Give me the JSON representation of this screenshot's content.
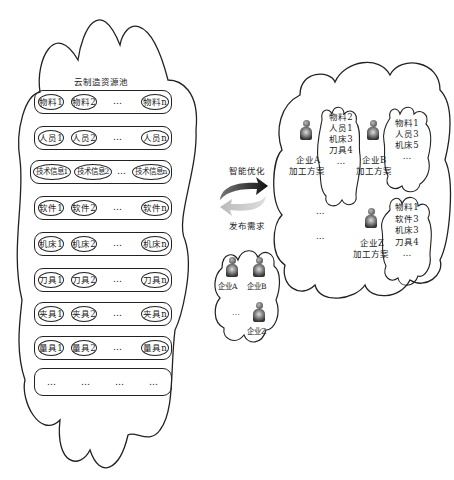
{
  "pool": {
    "title": "云制造资源池",
    "rows": [
      {
        "name": "material",
        "items": [
          "物料1",
          "物料2",
          "…",
          "物料n"
        ]
      },
      {
        "name": "personnel",
        "items": [
          "人员1",
          "人员2",
          "…",
          "人员n"
        ]
      },
      {
        "name": "tech-info",
        "items": [
          "技术信息1",
          "技术信息2",
          "…",
          "技术信息n"
        ]
      },
      {
        "name": "software",
        "items": [
          "软件1",
          "软件2",
          "…",
          "软件n"
        ]
      },
      {
        "name": "machine",
        "items": [
          "机床1",
          "机床2",
          "…",
          "机床n"
        ]
      },
      {
        "name": "tool",
        "items": [
          "刀具1",
          "刀具2",
          "…",
          "刀具n"
        ]
      },
      {
        "name": "fixture",
        "items": [
          "夹具1",
          "夹具2",
          "…",
          "夹具n"
        ]
      },
      {
        "name": "gauge",
        "items": [
          "量具1",
          "量具2",
          "…",
          "量具n"
        ]
      },
      {
        "name": "more",
        "items": [
          "…",
          "…",
          "…",
          "…"
        ]
      }
    ]
  },
  "arrows": {
    "top_label": "智能优化",
    "bottom_label": "发布需求"
  },
  "enterprises": {
    "a": "企业A",
    "b": "企业B",
    "dots": "…",
    "z": "企业Z"
  },
  "plans": {
    "a": {
      "line1": "企业A",
      "line2": "加工方案",
      "resources": [
        "物料2",
        "人员1",
        "机床3",
        "刀具4",
        "…"
      ]
    },
    "b": {
      "line1": "企业B",
      "line2": "加工方案",
      "resources": [
        "物料1",
        "人员3",
        "机床5",
        "…"
      ]
    },
    "z": {
      "line1": "企业Z",
      "line2": "加工方案",
      "resources": [
        "物料1",
        "软件3",
        "机床3",
        "刀具4",
        "…"
      ]
    },
    "dots1": "…",
    "dots2": "…"
  }
}
